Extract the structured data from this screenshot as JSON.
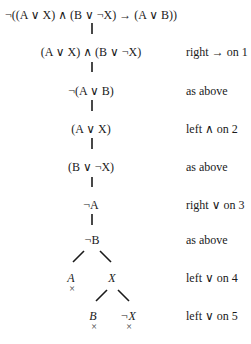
{
  "tree": {
    "nodes": [
      {
        "id": 1,
        "formula": "¬((A ∨ X) ∧ (B ∨ ¬X) → (A ∨ B))",
        "justification": ""
      },
      {
        "id": 2,
        "formula": "(A ∨ X) ∧ (B ∨ ¬X)",
        "justification": "right → on 1"
      },
      {
        "id": 3,
        "formula": "¬(A ∨ B)",
        "justification": "as above"
      },
      {
        "id": 4,
        "formula": "(A ∨ X)",
        "justification": "left ∧ on 2"
      },
      {
        "id": 5,
        "formula": "(B ∨ ¬X)",
        "justification": "as above"
      },
      {
        "id": 6,
        "formula": "¬A",
        "justification": "right ∨ on 3"
      },
      {
        "id": 7,
        "formula": "¬B",
        "justification": "as above"
      },
      {
        "id": 8,
        "branches": [
          {
            "formula": "A",
            "closed": true,
            "close_mark": "×"
          },
          {
            "formula": "X",
            "closed": false
          }
        ],
        "justification": "left ∨ on 4"
      },
      {
        "id": 9,
        "branches": [
          {
            "formula": "B",
            "closed": true,
            "close_mark": "×"
          },
          {
            "formula": "¬X",
            "closed": true,
            "close_mark": "×"
          }
        ],
        "justification": "left ∨ on 5"
      }
    ]
  }
}
